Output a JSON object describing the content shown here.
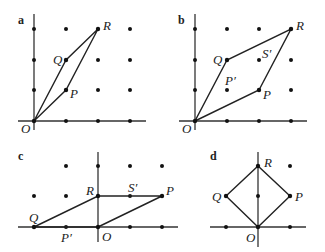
{
  "panels": [
    {
      "id": "a",
      "label": "a",
      "points": {
        "O": "O",
        "P": "P",
        "Q": "Q",
        "R": "R"
      },
      "grid": {
        "origin": [
          34,
          121
        ],
        "step": 32
      },
      "shape": "parallelogram O-P-R-Q"
    },
    {
      "id": "b",
      "label": "b",
      "points": {
        "O": "O",
        "P": "P",
        "Q": "Q",
        "R": "R",
        "P_prime": "P′",
        "S_prime": "S′"
      },
      "grid": {
        "origin": [
          195,
          121
        ],
        "step": 32
      },
      "shape": "parallelogram O-P-R-Q"
    },
    {
      "id": "c",
      "label": "c",
      "points": {
        "O": "O",
        "P": "P",
        "Q": "Q",
        "R": "R",
        "P_prime": "P′",
        "S_prime": "S′"
      },
      "grid": {
        "origin": [
          98,
          227
        ],
        "step": 32
      },
      "shape": "parallelogram O-P-R-Q (flattened)"
    },
    {
      "id": "d",
      "label": "d",
      "points": {
        "O": "O",
        "P": "P",
        "Q": "Q",
        "R": "R"
      },
      "grid": {
        "origin": [
          258,
          227
        ],
        "step": 32
      },
      "shape": "square O-P-R-Q"
    }
  ]
}
